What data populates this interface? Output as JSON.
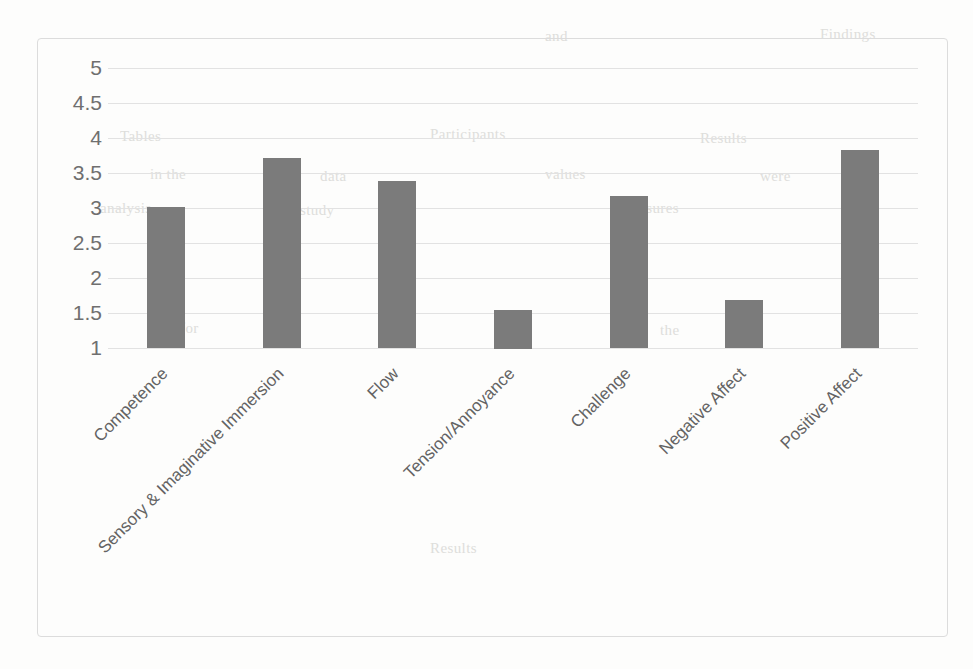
{
  "chart_data": {
    "type": "bar",
    "title": "",
    "subtitle": "",
    "xlabel": "",
    "ylabel": "",
    "categories": [
      "Competence",
      "Sensory & Imaginative Immersion",
      "Flow",
      "Tension/Annoyance",
      "Challenge",
      "Negative Affect",
      "Positive Affect"
    ],
    "values": [
      3.02,
      3.71,
      3.38,
      1.55,
      3.17,
      1.69,
      3.83
    ],
    "ylim": [
      1,
      5
    ],
    "yticks": [
      "1",
      "1.5",
      "2",
      "2.5",
      "3",
      "3.5",
      "4",
      "4.5",
      "5"
    ],
    "ytick_values": [
      1,
      1.5,
      2,
      2.5,
      3,
      3.5,
      4,
      4.5,
      5
    ],
    "grid": true,
    "legend": "none",
    "bar_color": "#7b7b7b",
    "gridline_color": "#e2e2e2",
    "tick_label_color": "#6f6f6f",
    "category_label_color": "#636363",
    "frame_border_color": "#dcdcdc",
    "background_color": "#fdfdfc",
    "label_rotation_degrees": -45
  },
  "page": {
    "bleed_through_text": [
      "and",
      "Findings",
      "Tables",
      "Participants",
      "Results",
      "in the",
      "data",
      "values",
      "were",
      "analysis",
      "study",
      "measures",
      "for",
      "the"
    ]
  }
}
